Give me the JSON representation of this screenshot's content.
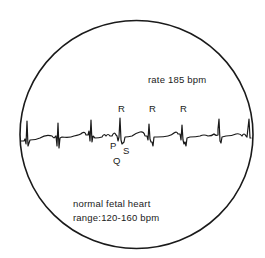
{
  "diagram": {
    "type": "fetal-ecg-monitor",
    "rate_label": "rate 185 bpm",
    "normal_label_line1": "normal fetal heart",
    "normal_label_line2": "range:120-160 bpm",
    "wave_labels": {
      "R1": "R",
      "R2": "R",
      "R3": "R",
      "P": "P",
      "Q": "Q",
      "S": "S"
    },
    "colors": {
      "ink": "#1a1a1a",
      "background": "#ffffff"
    }
  }
}
